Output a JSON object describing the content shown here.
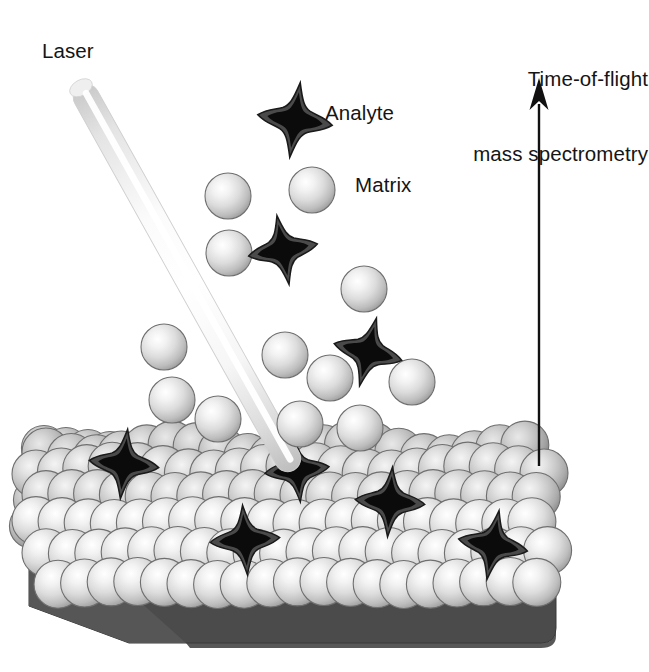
{
  "figure": {
    "background_color": "#ffffff"
  },
  "labels": {
    "laser": "Laser",
    "analyte": "Analyte",
    "matrix": "Matrix",
    "tof_line1": "Time-of-flight",
    "tof_line2": "mass spectrometry"
  },
  "colors": {
    "text": "#151515",
    "arrow": "#111111",
    "plate_top": "#4f4f4f",
    "plate_front": "#3f3f3f",
    "plate_bevel": "#585858",
    "sphere_highlight": "#ffffff",
    "sphere_mid": "#d3d3d3",
    "sphere_edge": "#8e8e8e",
    "sphere_outline": "#6f6f6f",
    "analyte_core": "#0b0b0b",
    "analyte_halo": "#4a4a4a",
    "analyte_outline": "#1a1a1a",
    "beam_core": "#ffffff",
    "beam_edge": "#b9b9b9",
    "beam_outline": "#cfcfcf"
  },
  "arrow": {
    "name": "time-of-flight-arrow",
    "x": 539,
    "y_tip": 78,
    "y_tail": 466,
    "head_width": 19,
    "head_height": 32,
    "shaft_width": 2.4
  },
  "laser_beam": {
    "name": "laser-beam",
    "x1": 80,
    "y1": 86,
    "x2": 294,
    "y2": 470,
    "width": 26
  },
  "plate": {
    "name": "sample-plate",
    "left": 29,
    "right": 556,
    "top": 548,
    "bottom": 643,
    "bevel": 58
  },
  "plume_spheres": [
    {
      "cx": 228,
      "cy": 196,
      "r": 23
    },
    {
      "cx": 312,
      "cy": 190,
      "r": 23
    },
    {
      "cx": 229,
      "cy": 253,
      "r": 23
    },
    {
      "cx": 364,
      "cy": 289,
      "r": 23
    },
    {
      "cx": 164,
      "cy": 347,
      "r": 23
    },
    {
      "cx": 285,
      "cy": 355,
      "r": 23
    },
    {
      "cx": 330,
      "cy": 378,
      "r": 23
    },
    {
      "cx": 412,
      "cy": 382,
      "r": 23
    },
    {
      "cx": 172,
      "cy": 400,
      "r": 23
    },
    {
      "cx": 218,
      "cy": 419,
      "r": 23
    },
    {
      "cx": 300,
      "cy": 424,
      "r": 23
    },
    {
      "cx": 360,
      "cy": 428,
      "r": 23
    }
  ],
  "plume_analytes": [
    {
      "cx": 295,
      "cy": 120,
      "r": 28,
      "rot": 8
    },
    {
      "cx": 283,
      "cy": 250,
      "r": 26,
      "rot": -10
    },
    {
      "cx": 368,
      "cy": 352,
      "r": 26,
      "rot": 14
    }
  ],
  "crystal_bed": {
    "name": "matrix-crystal-bed",
    "sphere_radius": 24,
    "rows": [
      {
        "y": 452,
        "x_start": 46,
        "count": 22,
        "step": 25.2,
        "skew": 0.0,
        "shade": 0.8
      },
      {
        "y": 470,
        "x_start": 36,
        "count": 22,
        "step": 25.4,
        "skew": 0.0,
        "shade": 0.86
      },
      {
        "y": 495,
        "x_start": 46,
        "count": 21,
        "step": 25.8,
        "skew": 0.0,
        "shade": 0.92
      },
      {
        "y": 522,
        "x_start": 36,
        "count": 21,
        "step": 26.1,
        "skew": 0.0,
        "shade": 0.97
      },
      {
        "y": 552,
        "x_start": 46,
        "count": 20,
        "step": 26.4,
        "skew": 0.0,
        "shade": 1.0
      },
      {
        "y": 583,
        "x_start": 58,
        "count": 19,
        "step": 26.6,
        "skew": 0.0,
        "shade": 1.0
      }
    ]
  },
  "embedded_analytes": [
    {
      "cx": 124,
      "cy": 464,
      "r": 26,
      "rot": 6
    },
    {
      "cx": 297,
      "cy": 470,
      "r": 24,
      "rot": -6
    },
    {
      "cx": 390,
      "cy": 502,
      "r": 26,
      "rot": 4
    },
    {
      "cx": 245,
      "cy": 540,
      "r": 26,
      "rot": -4
    },
    {
      "cx": 493,
      "cy": 545,
      "r": 26,
      "rot": 10
    }
  ]
}
